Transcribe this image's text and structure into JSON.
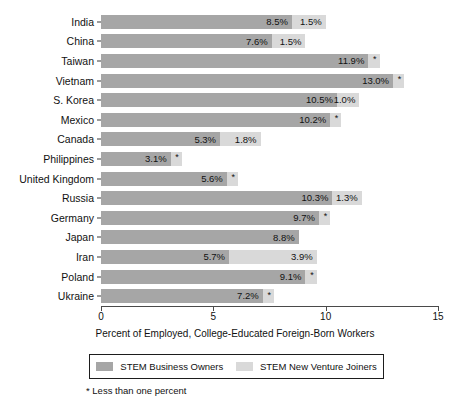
{
  "chart_data": {
    "type": "bar",
    "orientation": "horizontal",
    "stacked": true,
    "title": "",
    "xlabel": "Percent of Employed, College-Educated Foreign-Born Workers",
    "ylabel": "",
    "xlim": [
      0,
      15
    ],
    "xticks": [
      0,
      5,
      10,
      15
    ],
    "xtick_labels": [
      "0",
      "5",
      "10",
      "15"
    ],
    "grid": false,
    "legend_position": "bottom",
    "categories": [
      "India",
      "China",
      "Taiwan",
      "Vietnam",
      "S. Korea",
      "Mexico",
      "Canada",
      "Philippines",
      "United Kingdom",
      "Russia",
      "Germany",
      "Japan",
      "Iran",
      "Poland",
      "Ukraine"
    ],
    "series": [
      {
        "name": "STEM Business Owners",
        "color": "#a6a6a6",
        "values": [
          8.5,
          7.6,
          11.9,
          13.0,
          10.5,
          10.2,
          5.3,
          3.1,
          5.6,
          10.3,
          9.7,
          8.8,
          5.7,
          9.1,
          7.2
        ],
        "labels": [
          "8.5%",
          "7.6%",
          "11.9%",
          "13.0%",
          "10.5%",
          "10.2%",
          "5.3%",
          "3.1%",
          "5.6%",
          "10.3%",
          "9.7%",
          "8.8%",
          "5.7%",
          "9.1%",
          "7.2%"
        ]
      },
      {
        "name": "STEM New Venture Joiners",
        "color": "#d9d9d9",
        "values": [
          1.5,
          1.5,
          0.5,
          0.5,
          1.0,
          0.5,
          1.8,
          0.5,
          0.5,
          1.3,
          0.5,
          0,
          3.9,
          0.5,
          0.5
        ],
        "labels": [
          "1.5%",
          "1.5%",
          "*",
          "*",
          "1.0%",
          "*",
          "1.8%",
          "*",
          "*",
          "1.3%",
          "*",
          "",
          "3.9%",
          "*",
          "*"
        ]
      }
    ],
    "annotations": [
      "* Less than one percent"
    ]
  },
  "legend": {
    "items": [
      {
        "label": "STEM Business Owners"
      },
      {
        "label": "STEM New Venture Joiners"
      }
    ]
  },
  "footnote": "* Less than one percent"
}
